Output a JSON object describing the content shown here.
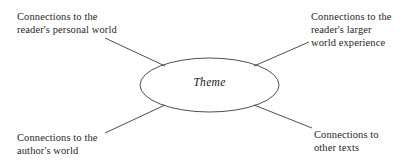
{
  "diagram": {
    "type": "concept-web",
    "background_color": "#ffffff",
    "line_color": "#3a3a3a",
    "text_color": "#1f1f1f",
    "center": {
      "shape": "ellipse",
      "label": "Theme",
      "cx": 209.5,
      "cy": 85,
      "rx": 69.5,
      "ry": 27
    },
    "branches": [
      {
        "id": "top-left",
        "label": "Connections to the\nreader's personal world",
        "line": {
          "x1": 165,
          "y1": 66,
          "x2": 105,
          "y2": 38
        }
      },
      {
        "id": "top-right",
        "label": "Connections to the\nreader's larger\nworld experience",
        "line": {
          "x1": 254,
          "y1": 66,
          "x2": 309,
          "y2": 42
        }
      },
      {
        "id": "bottom-left",
        "label": "Connections to the\nauthor's world",
        "line": {
          "x1": 165,
          "y1": 105,
          "x2": 105,
          "y2": 133
        }
      },
      {
        "id": "bottom-right",
        "label": "Connections to\nother texts",
        "line": {
          "x1": 254,
          "y1": 105,
          "x2": 312,
          "y2": 128
        }
      }
    ]
  }
}
